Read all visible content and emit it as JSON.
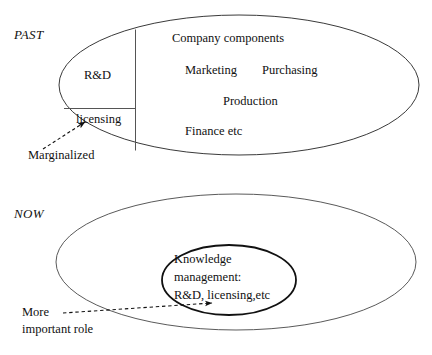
{
  "figure": {
    "panels": [
      {
        "era_label": "PAST",
        "outer_shape": "ellipse",
        "segments": [
          {
            "label": "R&D"
          },
          {
            "label": "licensing"
          }
        ],
        "company_components": {
          "heading": "Company components",
          "items": [
            "Marketing",
            "Purchasing",
            "Production",
            "Finance etc"
          ]
        },
        "callout": {
          "label": "Marginalized",
          "connector": "dashed-arrow"
        }
      },
      {
        "era_label": "NOW",
        "outer_shape": "ellipse",
        "inner_shape": "ellipse",
        "inner_lines": [
          "Knowledge",
          "management:",
          "R&D, licensing,etc"
        ],
        "callout": {
          "label_line1": "More",
          "label_line2": "important role",
          "connector": "dashed-arrow"
        }
      }
    ]
  },
  "colors": {
    "stroke": "#3a3a3a",
    "stroke_strong": "#111111",
    "text": "#111111",
    "background": "#ffffff"
  }
}
